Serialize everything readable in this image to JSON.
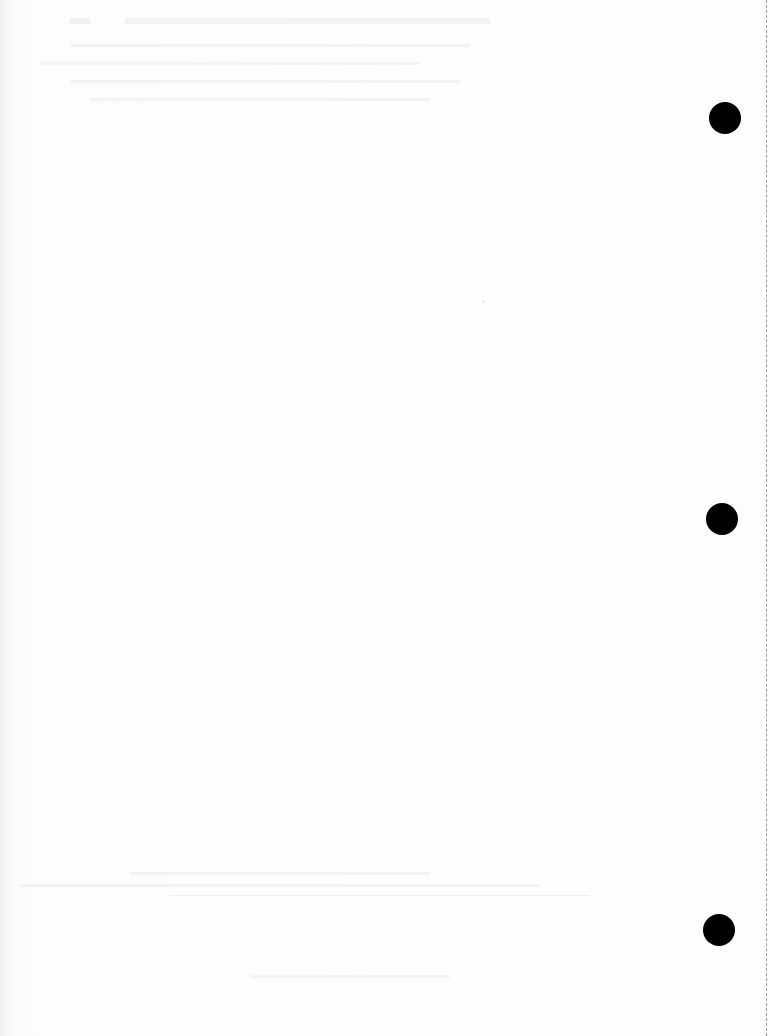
{
  "document": {
    "type": "scanned blank page",
    "visible_text": "",
    "punch_holes": 3,
    "colors": {
      "paper": "#fdfdfd",
      "hole": "#000000",
      "perforation": "#9a9a9a"
    }
  }
}
